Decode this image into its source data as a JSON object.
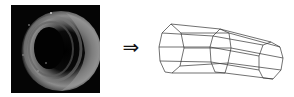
{
  "figure": {
    "left_panel": {
      "kind": "grayscale-cross-section-image",
      "description": "Dark grayscale image of a tubular lumen (ring-shaped vessel/airway cross-section) on black background"
    },
    "arrow": {
      "glyph": "⇒",
      "icon": "double-right-arrow-icon"
    },
    "right_panel": {
      "kind": "wireframe-3d-tube-model",
      "description": "Line-drawn polyhedral tube composed of three octagonal cross-section rings connected by longitudinal edges",
      "ring_count": 3
    },
    "colors": {
      "background": "#ffffff",
      "photo_background": "#050505",
      "wire_stroke": "#333333",
      "arrow": "#111111"
    }
  }
}
